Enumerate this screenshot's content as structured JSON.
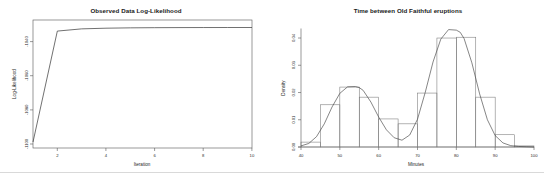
{
  "page": {
    "background_color": "#ffffff",
    "separator_color": "#d9d9d9",
    "width": 544,
    "height": 184
  },
  "chart_data": [
    {
      "id": "log-likelihood-plot",
      "type": "line",
      "title": "Observed Data Log-Likelihood",
      "xlabel": "Iteration",
      "ylabel": "Log-Likelihood",
      "xlim": [
        1,
        10
      ],
      "ylim": [
        -1105,
        -1030
      ],
      "grid": false,
      "legend": "none",
      "line_color": "#333333",
      "xticks": [
        2,
        4,
        6,
        8,
        10
      ],
      "xtick_labels": [
        "2",
        "4",
        "6",
        "8",
        "10"
      ],
      "yticks": [
        -1100,
        -1080,
        -1060,
        -1040
      ],
      "ytick_labels": [
        "-1100",
        "-1080",
        "-1060",
        "-1040"
      ],
      "x": [
        1,
        2,
        3,
        4,
        5,
        6,
        7,
        8,
        9,
        10
      ],
      "values": [
        -1101.5,
        -1036.5,
        -1035.2,
        -1034.8,
        -1034.6,
        -1034.5,
        -1034.45,
        -1034.42,
        -1034.4,
        -1034.4
      ]
    },
    {
      "id": "old-faithful-histogram",
      "type": "bar",
      "title": "Time between Old Faithful eruptions",
      "xlabel": "Minutes",
      "ylabel": "Density",
      "xlim": [
        40,
        100
      ],
      "ylim": [
        0,
        0.0435
      ],
      "grid": false,
      "legend": "none",
      "bar_edge_color": "#777777",
      "bar_fill_color": "none",
      "curve_color": "#444444",
      "xticks": [
        40,
        50,
        60,
        70,
        80,
        90,
        100
      ],
      "xtick_labels": [
        "40",
        "50",
        "60",
        "70",
        "80",
        "90",
        "100"
      ],
      "yticks": [
        0.0,
        0.01,
        0.02,
        0.03,
        0.04
      ],
      "ytick_labels": [
        "0.00",
        "0.01",
        "0.02",
        "0.03",
        "0.04"
      ],
      "bin_edges": [
        40,
        45,
        50,
        55,
        60,
        65,
        70,
        75,
        80,
        85,
        90,
        95,
        100
      ],
      "categories": [
        "40-45",
        "45-50",
        "50-55",
        "55-60",
        "60-65",
        "65-70",
        "70-75",
        "75-80",
        "80-85",
        "85-90",
        "90-95",
        "95-100"
      ],
      "values": [
        0.0018,
        0.0155,
        0.022,
        0.0183,
        0.0103,
        0.0085,
        0.0198,
        0.04,
        0.0403,
        0.0183,
        0.0045,
        0.0004
      ],
      "series": [
        {
          "name": "Fitted mixture density",
          "type": "line",
          "x": [
            40,
            42,
            44,
            46,
            48,
            50,
            52,
            54,
            55,
            56,
            58,
            60,
            62,
            64,
            66,
            68,
            70,
            72,
            74,
            76,
            78,
            80,
            81,
            82,
            84,
            86,
            88,
            90,
            92,
            94,
            96,
            98,
            100
          ],
          "values": [
            0.0004,
            0.0013,
            0.0038,
            0.0085,
            0.0147,
            0.0197,
            0.0221,
            0.0222,
            0.0218,
            0.0208,
            0.0165,
            0.011,
            0.0063,
            0.0034,
            0.0025,
            0.0044,
            0.0102,
            0.0201,
            0.0312,
            0.0396,
            0.0431,
            0.0429,
            0.0421,
            0.0398,
            0.0309,
            0.0195,
            0.01,
            0.0042,
            0.0015,
            0.0005,
            0.0002,
            0.0001,
            0.0
          ]
        }
      ]
    }
  ]
}
